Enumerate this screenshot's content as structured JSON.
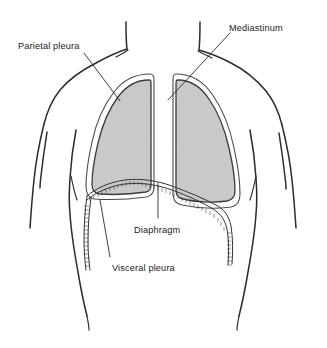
{
  "figure": {
    "background_color": "#ffffff",
    "ink_color": "#2b2b2b",
    "lung_fill_color": "#c9c9c9",
    "pleural_space_color": "#ffffff"
  },
  "labels": {
    "parietal_pleura": "Parietal pleura",
    "mediastinum": "Mediastinum",
    "diaphragm": "Diaphragm",
    "visceral_pleura": "Visceral pleura"
  },
  "structures": {
    "left_lung": "left-lung",
    "right_lung": "right-lung",
    "parietal_pleura_layer": "parietal-pleura-layer",
    "visceral_pleura_layer": "visceral-pleura-layer",
    "mediastinum_space": "mediastinum-space",
    "diaphragm_membrane": "diaphragm-membrane",
    "torso": "torso-outline"
  }
}
